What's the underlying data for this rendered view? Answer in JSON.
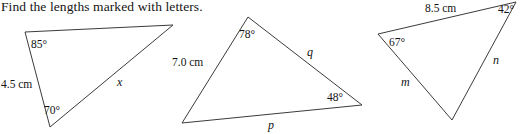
{
  "page": {
    "width": 524,
    "height": 134,
    "background": "#ffffff",
    "ink": "#141414",
    "stroke_color": "#3b3b3b"
  },
  "instruction": {
    "text": "Find the lengths marked with letters."
  },
  "figures": [
    {
      "id": "triangle-1",
      "name": "triangle-left",
      "vertices": {
        "top_left": [
          25,
          32
        ],
        "top_right": [
          173,
          25
        ],
        "bottom": [
          50,
          127
        ]
      },
      "labels": [
        {
          "name": "angle-85",
          "kind": "angle",
          "text": "85°",
          "x": 31,
          "y": 38
        },
        {
          "name": "angle-70",
          "kind": "angle",
          "text": "70°",
          "x": 44,
          "y": 104
        },
        {
          "name": "side-4-5-cm",
          "kind": "length",
          "text": "4.5 cm",
          "x": 1,
          "y": 78
        },
        {
          "name": "side-x",
          "kind": "variable",
          "text": "x",
          "x": 117,
          "y": 76
        }
      ]
    },
    {
      "id": "triangle-2",
      "name": "triangle-middle",
      "vertices": {
        "top": [
          248,
          17
        ],
        "bottom_left": [
          182,
          123
        ],
        "right": [
          362,
          105
        ]
      },
      "labels": [
        {
          "name": "angle-78",
          "kind": "angle",
          "text": "78°",
          "x": 239,
          "y": 28
        },
        {
          "name": "angle-48",
          "kind": "angle",
          "text": "48°",
          "x": 327,
          "y": 91
        },
        {
          "name": "side-7-0-cm",
          "kind": "length",
          "text": "7.0 cm",
          "x": 172,
          "y": 56
        },
        {
          "name": "side-q",
          "kind": "variable",
          "text": "q",
          "x": 307,
          "y": 46
        },
        {
          "name": "side-p",
          "kind": "variable",
          "text": "p",
          "x": 268,
          "y": 119
        }
      ]
    },
    {
      "id": "triangle-3",
      "name": "triangle-right",
      "vertices": {
        "left": [
          378,
          34
        ],
        "top_right": [
          516,
          2
        ],
        "bottom": [
          452,
          120
        ]
      },
      "labels": [
        {
          "name": "angle-67",
          "kind": "angle",
          "text": "67°",
          "x": 389,
          "y": 36
        },
        {
          "name": "angle-42",
          "kind": "angle",
          "text": "42°",
          "x": 498,
          "y": 3
        },
        {
          "name": "side-8-5-cm",
          "kind": "length",
          "text": "8.5 cm",
          "x": 425,
          "y": 2
        },
        {
          "name": "side-n",
          "kind": "variable",
          "text": "n",
          "x": 493,
          "y": 54
        },
        {
          "name": "side-m",
          "kind": "variable",
          "text": "m",
          "x": 401,
          "y": 76
        }
      ]
    }
  ]
}
